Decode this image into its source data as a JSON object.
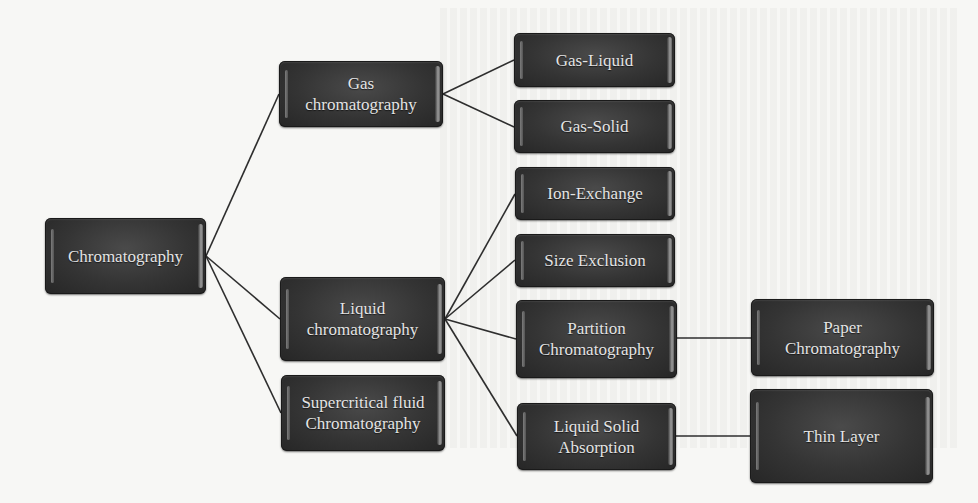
{
  "diagram": {
    "colors": {
      "node_fill": "#343434",
      "node_text": "#e4e4e4",
      "connector": "#2e2e2e",
      "background": "#f7f7f5"
    },
    "nodes": {
      "root": {
        "label": "Chromatography"
      },
      "gas": {
        "label": "Gas chromatography",
        "line1": "Gas",
        "line2": "chromatography"
      },
      "liquid": {
        "label": "Liquid chromatography",
        "line1": "Liquid",
        "line2": "chromatography"
      },
      "supercritical": {
        "label": "Supercritical fluid Chromatography",
        "line1": "Supercritical fluid",
        "line2": "Chromatography"
      },
      "gas_liquid": {
        "label": "Gas-Liquid"
      },
      "gas_solid": {
        "label": "Gas-Solid"
      },
      "ion_exchange": {
        "label": "Ion-Exchange"
      },
      "size_exclusion": {
        "label": "Size Exclusion"
      },
      "partition": {
        "label": "Partition Chromatography",
        "line1": "Partition",
        "line2": "Chromatography"
      },
      "liquid_solid": {
        "label": "Liquid Solid Absorption",
        "line1": "Liquid Solid",
        "line2": "Absorption"
      },
      "paper": {
        "label": "Paper Chromatography",
        "line1": "Paper",
        "line2": "Chromatography"
      },
      "thin_layer": {
        "label": "Thin Layer"
      }
    },
    "edges": [
      [
        "root",
        "gas"
      ],
      [
        "root",
        "liquid"
      ],
      [
        "root",
        "supercritical"
      ],
      [
        "gas",
        "gas_liquid"
      ],
      [
        "gas",
        "gas_solid"
      ],
      [
        "liquid",
        "ion_exchange"
      ],
      [
        "liquid",
        "size_exclusion"
      ],
      [
        "liquid",
        "partition"
      ],
      [
        "liquid",
        "liquid_solid"
      ],
      [
        "partition",
        "paper"
      ],
      [
        "liquid_solid",
        "thin_layer"
      ]
    ]
  }
}
